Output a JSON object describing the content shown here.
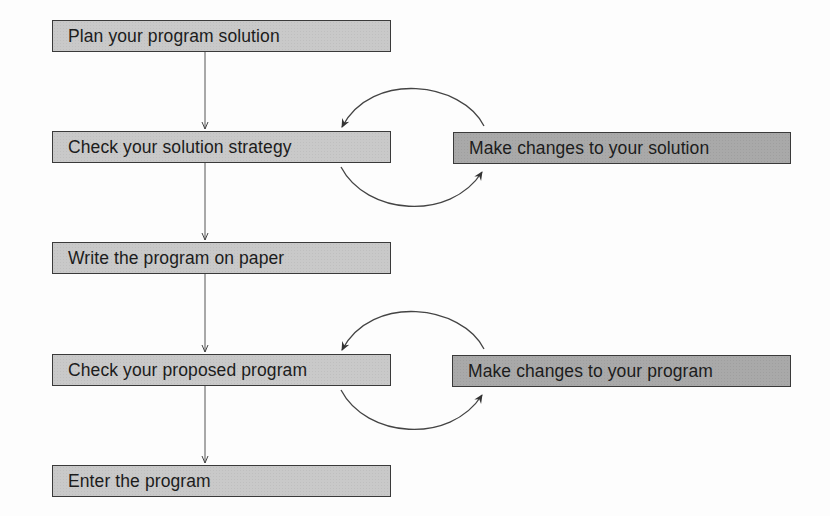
{
  "diagram": {
    "type": "flowchart",
    "colors": {
      "main_box_fill": "#c9c9c9",
      "side_box_fill": "#a9a9a9",
      "border": "#3a3a3a",
      "line": "#444444",
      "text": "#1c1c1c"
    },
    "steps": [
      {
        "id": "plan",
        "label": "Plan your program solution"
      },
      {
        "id": "check-strategy",
        "label": "Check your solution strategy"
      },
      {
        "id": "write",
        "label": "Write the program on paper"
      },
      {
        "id": "check-program",
        "label": "Check your proposed program"
      },
      {
        "id": "enter",
        "label": "Enter the program"
      }
    ],
    "side_steps": [
      {
        "id": "change-solution",
        "label": "Make changes to your solution",
        "loops_with": "check-strategy"
      },
      {
        "id": "change-program",
        "label": "Make changes to your program",
        "loops_with": "check-program"
      }
    ],
    "edges": [
      {
        "from": "plan",
        "to": "check-strategy"
      },
      {
        "from": "check-strategy",
        "to": "change-solution"
      },
      {
        "from": "change-solution",
        "to": "check-strategy"
      },
      {
        "from": "check-strategy",
        "to": "write"
      },
      {
        "from": "write",
        "to": "check-program"
      },
      {
        "from": "check-program",
        "to": "change-program"
      },
      {
        "from": "change-program",
        "to": "check-program"
      },
      {
        "from": "check-program",
        "to": "enter"
      }
    ]
  }
}
